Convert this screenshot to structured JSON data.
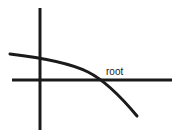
{
  "figure": {
    "background_color": "#ffffff",
    "ink_color": "#1a1a1a",
    "width": 178,
    "height": 135
  },
  "annotations": {
    "root_label": "root"
  },
  "chart_data": {
    "type": "line",
    "title": "",
    "xlabel": "",
    "ylabel": "",
    "grid": false,
    "legend": null,
    "axes": {
      "origin_px": [
        40,
        80
      ],
      "vertical_axis": {
        "x_px": 40,
        "y_start_px": 8,
        "y_end_px": 130,
        "stroke_width": 3
      },
      "horizontal_axis": {
        "y_px": 80,
        "x_start_px": 12,
        "x_end_px": 172,
        "stroke_width": 3
      }
    },
    "series": [
      {
        "name": "f(x)",
        "stroke_width": 3,
        "points_px": [
          [
            10,
            54
          ],
          [
            30,
            57
          ],
          [
            50,
            60
          ],
          [
            70,
            64
          ],
          [
            85,
            70
          ],
          [
            95,
            75
          ],
          [
            103,
            80
          ],
          [
            112,
            87
          ],
          [
            122,
            97
          ],
          [
            130,
            107
          ],
          [
            137,
            116
          ]
        ],
        "path_d": "M 10 54 C 40 57.5 70 63 88 72 C 104 80 122 98 137 116"
      }
    ],
    "annotations": [
      {
        "label": "root",
        "kind": "point-label",
        "point_px": [
          103,
          80
        ],
        "label_position_px": [
          106,
          75
        ],
        "note": "x-intercept of the curve"
      }
    ],
    "x_intercept_px": [
      103,
      80
    ],
    "y_intercept_px": [
      40,
      58
    ]
  }
}
